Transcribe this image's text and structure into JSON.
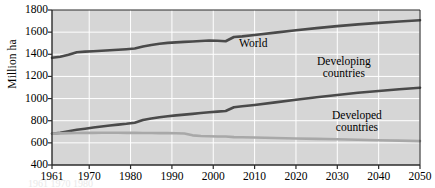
{
  "chart_data": {
    "type": "line",
    "title": "",
    "xlabel": "",
    "ylabel": "Million ha",
    "xlim": [
      1961,
      2050
    ],
    "ylim": [
      400,
      1800
    ],
    "ytick_step": 200,
    "grid": true,
    "legend_position": "inline-annotations",
    "plot_background": "#d6d6d6",
    "grid_color": "#ffffff",
    "axis_color": "#2b2b2b",
    "xticks": [
      1961,
      1970,
      1980,
      1990,
      2000,
      2010,
      2020,
      2030,
      2040,
      2050
    ],
    "xtick_labels": [
      "1961",
      "1970",
      "1980",
      "1990",
      "2000",
      "2010",
      "2020",
      "2030",
      "2040",
      "2050"
    ],
    "yticks": [
      400,
      600,
      800,
      1000,
      1200,
      1400,
      1600,
      1800
    ],
    "ytick_labels": [
      "400",
      "600",
      "800",
      "1000",
      "1200",
      "1400",
      "1600",
      "1800"
    ],
    "series": [
      {
        "name": "World",
        "color": "#4a4a4a",
        "width": 2.6,
        "label_text": "World",
        "points": [
          [
            1961,
            1368
          ],
          [
            1963,
            1378
          ],
          [
            1965,
            1395
          ],
          [
            1967,
            1418
          ],
          [
            1969,
            1424
          ],
          [
            1971,
            1428
          ],
          [
            1973,
            1432
          ],
          [
            1975,
            1437
          ],
          [
            1977,
            1441
          ],
          [
            1979,
            1446
          ],
          [
            1981,
            1452
          ],
          [
            1983,
            1470
          ],
          [
            1985,
            1484
          ],
          [
            1987,
            1495
          ],
          [
            1989,
            1503
          ],
          [
            1991,
            1508
          ],
          [
            1993,
            1512
          ],
          [
            1995,
            1516
          ],
          [
            1997,
            1520
          ],
          [
            1999,
            1524
          ],
          [
            2001,
            1522
          ],
          [
            2003,
            1518
          ],
          [
            2005,
            1556
          ],
          [
            2007,
            1562
          ],
          [
            2010,
            1574
          ],
          [
            2015,
            1596
          ],
          [
            2020,
            1617
          ],
          [
            2025,
            1636
          ],
          [
            2030,
            1654
          ],
          [
            2035,
            1670
          ],
          [
            2040,
            1684
          ],
          [
            2045,
            1696
          ],
          [
            2050,
            1708
          ]
        ]
      },
      {
        "name": "Developing countries",
        "color": "#4a4a4a",
        "width": 2.6,
        "label_text": "Developing\ncountries",
        "label_line1": "Developing",
        "label_line2": "countries",
        "points": [
          [
            1961,
            683
          ],
          [
            1963,
            692
          ],
          [
            1965,
            705
          ],
          [
            1967,
            718
          ],
          [
            1969,
            728
          ],
          [
            1971,
            738
          ],
          [
            1973,
            748
          ],
          [
            1975,
            757
          ],
          [
            1977,
            765
          ],
          [
            1979,
            772
          ],
          [
            1981,
            782
          ],
          [
            1983,
            806
          ],
          [
            1985,
            820
          ],
          [
            1987,
            831
          ],
          [
            1989,
            840
          ],
          [
            1991,
            848
          ],
          [
            1993,
            855
          ],
          [
            1995,
            862
          ],
          [
            1997,
            869
          ],
          [
            1999,
            876
          ],
          [
            2001,
            882
          ],
          [
            2003,
            888
          ],
          [
            2005,
            922
          ],
          [
            2007,
            930
          ],
          [
            2010,
            942
          ],
          [
            2015,
            966
          ],
          [
            2020,
            990
          ],
          [
            2025,
            1012
          ],
          [
            2030,
            1033
          ],
          [
            2035,
            1052
          ],
          [
            2040,
            1069
          ],
          [
            2045,
            1084
          ],
          [
            2050,
            1098
          ]
        ]
      },
      {
        "name": "Developed countries",
        "color": "#a8a8a8",
        "width": 2.6,
        "label_text": "Developed\ncountries",
        "label_line1": "Developed",
        "label_line2": "countries",
        "points": [
          [
            1961,
            683
          ],
          [
            1963,
            686
          ],
          [
            1965,
            688
          ],
          [
            1967,
            689
          ],
          [
            1969,
            690
          ],
          [
            1971,
            690
          ],
          [
            1973,
            691
          ],
          [
            1975,
            691
          ],
          [
            1977,
            691
          ],
          [
            1979,
            690
          ],
          [
            1981,
            690
          ],
          [
            1983,
            689
          ],
          [
            1985,
            689
          ],
          [
            1987,
            688
          ],
          [
            1989,
            688
          ],
          [
            1991,
            687
          ],
          [
            1993,
            685
          ],
          [
            1995,
            668
          ],
          [
            1997,
            662
          ],
          [
            1999,
            660
          ],
          [
            2001,
            658
          ],
          [
            2003,
            657
          ],
          [
            2005,
            652
          ],
          [
            2007,
            650
          ],
          [
            2010,
            648
          ],
          [
            2015,
            644
          ],
          [
            2020,
            640
          ],
          [
            2025,
            636
          ],
          [
            2030,
            632
          ],
          [
            2035,
            628
          ],
          [
            2040,
            624
          ],
          [
            2045,
            620
          ],
          [
            2050,
            616
          ]
        ]
      }
    ],
    "annotations": [
      {
        "text": "World",
        "x": 2010,
        "y": 1500
      },
      {
        "text": "Developing countries",
        "x": 2032,
        "y": 1240
      },
      {
        "text": "Developed countries",
        "x": 2036,
        "y": 820
      }
    ]
  },
  "axis": {
    "y_title": "Million ha"
  },
  "labels": {
    "world": "World",
    "developing_line1": "Developing",
    "developing_line2": "countries",
    "developed_line1": "Developed",
    "developed_line2": "countries"
  },
  "bottom_caption": "1961 1970 1980"
}
